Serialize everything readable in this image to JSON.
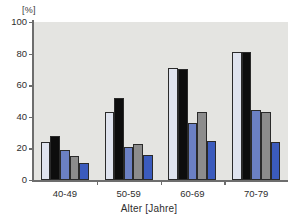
{
  "chart_data": {
    "type": "bar",
    "title": "",
    "unit_label": "[%]",
    "xlabel": "Alter [Jahre]",
    "ylabel": "",
    "ylim": [
      0,
      100
    ],
    "yticks": [
      0,
      20,
      40,
      60,
      80,
      100
    ],
    "ytick_labels": [
      "0",
      "20",
      "40",
      "60",
      "80",
      "100"
    ],
    "grid": false,
    "legend": "none",
    "categories": [
      "40-49",
      "50-59",
      "60-69",
      "70-79"
    ],
    "series": [
      {
        "name": "series-1",
        "color": "#dfe3ee",
        "values": [
          24,
          43,
          71,
          81
        ]
      },
      {
        "name": "series-2",
        "color": "#0d0d0d",
        "values": [
          28,
          52,
          70,
          81
        ]
      },
      {
        "name": "series-3",
        "color": "#6b80c4",
        "values": [
          19,
          21,
          36,
          44
        ]
      },
      {
        "name": "series-4",
        "color": "#8c8c8c",
        "values": [
          15,
          23,
          43,
          43
        ]
      },
      {
        "name": "series-5",
        "color": "#3b5bbd",
        "values": [
          11,
          16,
          25,
          24
        ]
      }
    ]
  },
  "colors": {
    "plot_background": "#e4e4e1",
    "page_background": "#ffffff",
    "axis": "#6d6d6d",
    "text": "#2e2e2e",
    "bar_outline": "#2a2a2a"
  }
}
